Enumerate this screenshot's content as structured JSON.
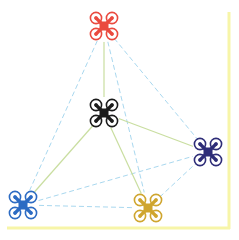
{
  "diagram": {
    "type": "drone-swarm-network",
    "border_color": "#f7f5a8",
    "solid_link_color": "#c9dea0",
    "dashed_link_color": "#a9d8ef",
    "drones": [
      {
        "id": "red",
        "icon": "quadcopter-icon",
        "color": "#ea4a3f",
        "x": 104,
        "y": 26
      },
      {
        "id": "black",
        "icon": "quadcopter-icon",
        "color": "#1b1b1b",
        "x": 104,
        "y": 113
      },
      {
        "id": "navy",
        "icon": "quadcopter-icon",
        "color": "#2e2d78",
        "x": 208,
        "y": 152
      },
      {
        "id": "blue",
        "icon": "quadcopter-icon",
        "color": "#2c6bc3",
        "x": 23,
        "y": 205
      },
      {
        "id": "gold",
        "icon": "quadcopter-icon",
        "color": "#cfa52e",
        "x": 148,
        "y": 208
      }
    ],
    "solid_links": [
      [
        "red",
        "black"
      ],
      [
        "black",
        "blue"
      ],
      [
        "black",
        "gold"
      ],
      [
        "black",
        "navy"
      ]
    ],
    "dashed_links": [
      [
        "red",
        "blue"
      ],
      [
        "red",
        "gold"
      ],
      [
        "red",
        "navy"
      ],
      [
        "blue",
        "navy"
      ],
      [
        "blue",
        "gold"
      ],
      [
        "gold",
        "navy"
      ]
    ]
  }
}
